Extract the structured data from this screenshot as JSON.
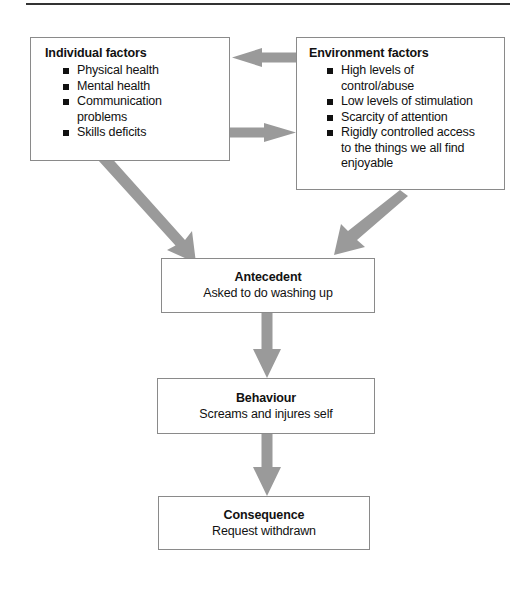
{
  "figure": {
    "kind": "abc-behaviour-flow-diagram",
    "divider_color": "#333333",
    "box_border_color": "#8a8a8a",
    "arrow_color": "#9a9a9a",
    "text_color": "#111111"
  },
  "boxes": {
    "individual": {
      "title": "Individual factors",
      "items": [
        {
          "text": "Physical health"
        },
        {
          "text": "Mental health"
        },
        {
          "text": "Communication",
          "continuation": "problems"
        },
        {
          "text": "Skills deficits"
        }
      ]
    },
    "environment": {
      "title": "Environment factors",
      "items": [
        {
          "text": "High levels of",
          "continuation": "control/abuse"
        },
        {
          "text": "Low levels of stimulation"
        },
        {
          "text": "Scarcity of attention"
        },
        {
          "text": "Rigidly controlled access",
          "continuation": "to the things we all find",
          "continuation2": "enjoyable"
        }
      ]
    },
    "antecedent": {
      "title": "Antecedent",
      "subtitle": "Asked to do washing up"
    },
    "behaviour": {
      "title": "Behaviour",
      "subtitle": "Screams and injures self"
    },
    "consequence": {
      "title": "Consequence",
      "subtitle": "Request withdrawn"
    }
  },
  "arrows": [
    {
      "name": "environment-to-individual",
      "direction": "left"
    },
    {
      "name": "individual-to-environment",
      "direction": "right"
    },
    {
      "name": "individual-to-antecedent",
      "direction": "down-right"
    },
    {
      "name": "environment-to-antecedent",
      "direction": "down-left"
    },
    {
      "name": "antecedent-to-behaviour",
      "direction": "down"
    },
    {
      "name": "behaviour-to-consequence",
      "direction": "down"
    }
  ]
}
